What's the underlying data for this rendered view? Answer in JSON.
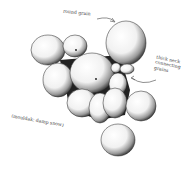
{
  "figure": {
    "labels": {
      "round_grain": "round grain",
      "thick_neck": [
        "thick neck",
        "connecting",
        "grains"
      ],
      "caption": "(mouldak: damp snow)"
    },
    "colors": {
      "ink": "#1a1a1a",
      "paper": "#ffffff",
      "label": "#444444"
    }
  }
}
